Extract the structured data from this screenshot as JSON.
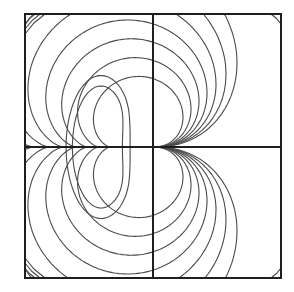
{
  "figure": {
    "type": "contour-plot",
    "colors": {
      "background": "#ffffff",
      "frame": "#1e1e1e",
      "contour": "#4a4a4a"
    },
    "axes": {
      "horizontal": true,
      "vertical": true,
      "labels": []
    },
    "through_origin_levels": [
      0.3,
      0.38,
      0.46,
      0.54,
      0.63,
      0.73,
      0.84
    ],
    "closed_loop_levels": [
      0.28,
      0.42
    ],
    "corner_arc_levels": {
      "top-left": [
        1,
        2,
        3
      ],
      "top-right": [
        1
      ],
      "bottom-left": [
        1,
        2,
        3
      ],
      "bottom-right": [
        1
      ]
    }
  }
}
